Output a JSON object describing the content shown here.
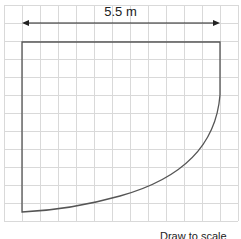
{
  "diagram": {
    "dimension_label": "5.5 m",
    "footer_text": "Draw to scale",
    "colors": {
      "grid": "#d9d9d9",
      "shape": "#555555",
      "arrow": "#222222"
    },
    "grid": {
      "spacing_px": 18,
      "origin_x": 4,
      "origin_y": 5,
      "cols": 13,
      "rows": 12
    },
    "shape": {
      "top_y": 42,
      "left_x": 22,
      "right_x": 220,
      "bottom_y": 212,
      "curve_start_y": 95
    }
  }
}
